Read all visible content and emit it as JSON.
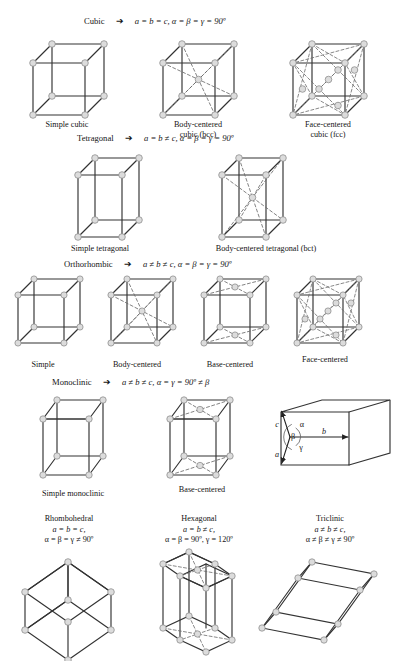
{
  "figure": {
    "colors": {
      "edge": "#222222",
      "hidden_edge": "#6b6b6b",
      "node_fill": "#dcdcdc",
      "node_stroke": "#8a8a8a",
      "background": "#ffffff",
      "text": "#141414"
    },
    "arrow_glyph": "➔"
  },
  "systems": [
    {
      "name": "Cubic",
      "relation": "a = b = c, α = β = γ = 90º",
      "cells": [
        {
          "label_line1": "Simple cubic",
          "label_line2": ""
        },
        {
          "label_line1": "Body-centered",
          "label_line2": "cubic (bcc)"
        },
        {
          "label_line1": "Face-centered",
          "label_line2": "cubic (fcc)"
        }
      ]
    },
    {
      "name": "Tetragonal",
      "relation": "a = b ≠ c, α = β = γ = 90º",
      "cells": [
        {
          "label_line1": "Simple tetragonal",
          "label_line2": ""
        },
        {
          "label_line1": "Body-centered tetragonal (bct)",
          "label_line2": ""
        }
      ]
    },
    {
      "name": "Orthorhombic",
      "relation": "a ≠ b ≠ c, α = β = γ = 90º",
      "cells": [
        {
          "label_line1": "Simple",
          "label_line2": ""
        },
        {
          "label_line1": "Body-centered",
          "label_line2": ""
        },
        {
          "label_line1": "Base-centered",
          "label_line2": ""
        },
        {
          "label_line1": "Face-centered",
          "label_line2": ""
        }
      ]
    },
    {
      "name": "Monoclinic",
      "relation": "a ≠ b ≠ c, α = γ = 90º ≠ β",
      "cells": [
        {
          "label_line1": "Simple monoclinic",
          "label_line2": ""
        },
        {
          "label_line1": "Base-centered",
          "label_line2": ""
        }
      ]
    }
  ],
  "axes_diagram": {
    "vector_a": "a",
    "vector_b": "b",
    "vector_c": "c",
    "angle_alpha": "α",
    "angle_beta": "β",
    "angle_gamma": "γ"
  },
  "bottom_systems": [
    {
      "name": "Rhombohedral",
      "line2": "a = b = c,",
      "line3": "α = β = γ ≠ 90º"
    },
    {
      "name": "Hexagonal",
      "line2": "a = b ≠ c,",
      "line3": "α = β = 90º, γ = 120º"
    },
    {
      "name": "Triclinic",
      "line2": "a ≠ b ≠ c,",
      "line3": "α ≠ β ≠ γ ≠ 90º"
    }
  ]
}
